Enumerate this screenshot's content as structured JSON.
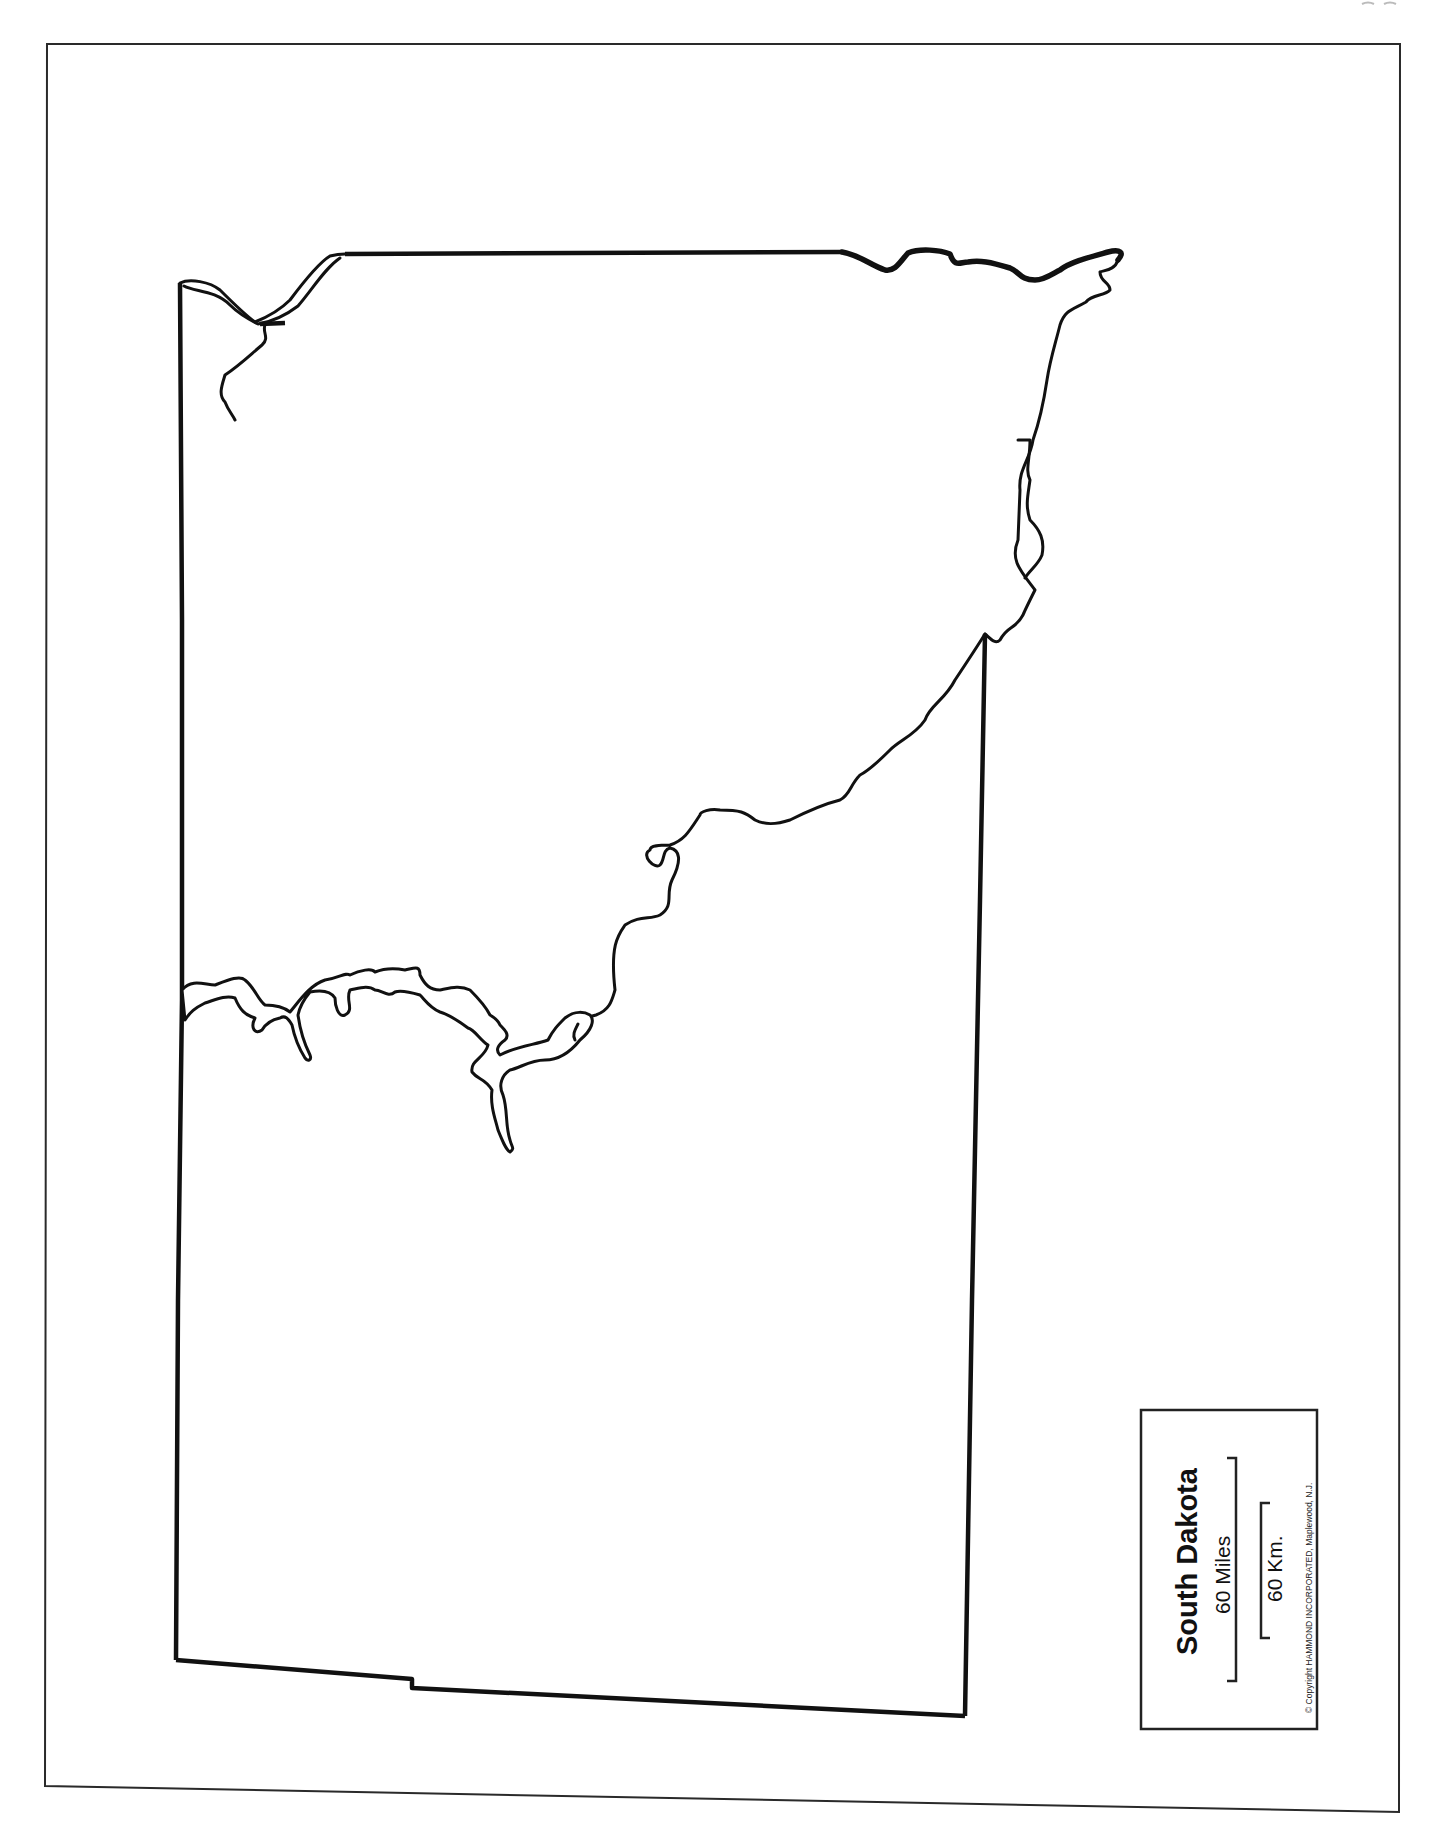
{
  "map": {
    "title": "South Dakota",
    "type": "outline map",
    "features": [
      "state-border",
      "missouri-river",
      "lake-oahe",
      "lake-sharpe",
      "lake-francis-case",
      "lewis-and-clark-lake"
    ]
  },
  "legend": {
    "title": "South Dakota",
    "scale_miles_label": "60 Miles",
    "scale_km_label": "60 Km.",
    "copyright": "© Copyright HAMMOND INCORPORATED, Maplewood, N.J."
  },
  "colors": {
    "ink": "#111111",
    "paper": "#ffffff"
  }
}
